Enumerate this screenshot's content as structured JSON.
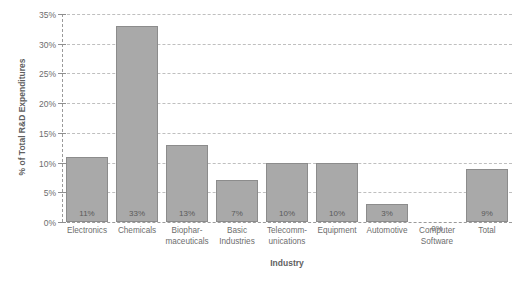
{
  "chart_data": {
    "type": "bar",
    "title": "",
    "xlabel": "Industry",
    "ylabel": "% of Total R&D Expenditures",
    "ylim": [
      0,
      35
    ],
    "ytick_labels": [
      "0%",
      "5%",
      "10%",
      "15%",
      "20%",
      "25%",
      "30%",
      "35%"
    ],
    "ytick_values": [
      0,
      5,
      10,
      15,
      20,
      25,
      30,
      35
    ],
    "grid": true,
    "legend": "none",
    "bar_color": "#a9a9a9",
    "bar_border_color": "#8c8c8c",
    "gridline_color": "#bfbfbf",
    "categories": [
      "Electronics",
      "Chemicals",
      "Biophar-\nmaceuticals",
      "Basic\nIndustries",
      "Telecomm-\nunications",
      "Equipment",
      "Automotive",
      "Computer\nSoftware",
      "Total"
    ],
    "category_lines": [
      [
        "Electronics"
      ],
      [
        "Chemicals"
      ],
      [
        "Biophar-",
        "maceuticals"
      ],
      [
        "Basic",
        "Industries"
      ],
      [
        "Telecomm-",
        "unications"
      ],
      [
        "Equipment"
      ],
      [
        "Automotive"
      ],
      [
        "Computer",
        "Software"
      ],
      [
        "Total"
      ]
    ],
    "values": [
      11,
      33,
      13,
      7,
      10,
      10,
      3,
      0,
      9
    ],
    "data_labels": [
      "11%",
      "33%",
      "13%",
      "7%",
      "10%",
      "10%",
      "3%",
      "0%",
      "9%"
    ]
  }
}
